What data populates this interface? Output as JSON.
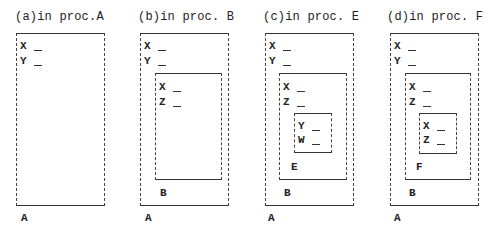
{
  "panels": [
    {
      "title": "(a)in proc.A",
      "outer_label": "A",
      "outer_vars": [
        "X",
        "Y"
      ]
    },
    {
      "title": "(b)in proc. B",
      "outer_label": "A",
      "outer_vars": [
        "X",
        "Y"
      ],
      "inner_label": "B",
      "inner_vars": [
        "X",
        "Z"
      ]
    },
    {
      "title": "(c)in proc. E",
      "outer_label": "A",
      "outer_vars": [
        "X",
        "Y"
      ],
      "inner_label": "B",
      "inner_vars": [
        "X",
        "Z"
      ],
      "innermost_label": "E",
      "innermost_vars": [
        "Y",
        "W"
      ]
    },
    {
      "title": "(d)in proc. F",
      "outer_label": "A",
      "outer_vars": [
        "X",
        "Y"
      ],
      "inner_label": "B",
      "inner_vars": [
        "X",
        "Z"
      ],
      "innermost_label": "F",
      "innermost_vars": [
        "X",
        "Z"
      ]
    }
  ]
}
